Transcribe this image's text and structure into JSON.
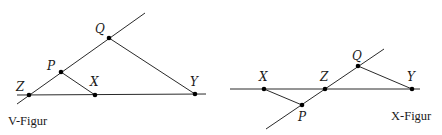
{
  "figures": [
    {
      "caption": "V-Figur",
      "points": {
        "Z": {
          "label": "Z",
          "x": 29,
          "y": 95
        },
        "P": {
          "label": "P",
          "x": 61,
          "y": 72
        },
        "Q": {
          "label": "Q",
          "x": 109,
          "y": 38
        },
        "X": {
          "label": "X",
          "x": 95,
          "y": 95
        },
        "Y": {
          "label": "Y",
          "x": 195,
          "y": 94
        }
      }
    },
    {
      "caption": "X-Figur",
      "points": {
        "X": {
          "label": "X",
          "x": 264,
          "y": 89
        },
        "Z": {
          "label": "Z",
          "x": 325,
          "y": 89
        },
        "Q": {
          "label": "Q",
          "x": 358,
          "y": 66
        },
        "P": {
          "label": "P",
          "x": 302,
          "y": 105
        },
        "Y": {
          "label": "Y",
          "x": 412,
          "y": 89
        }
      }
    }
  ],
  "colors": {
    "line": "#2a2a2a",
    "point": "#000000",
    "background": "#ffffff"
  }
}
